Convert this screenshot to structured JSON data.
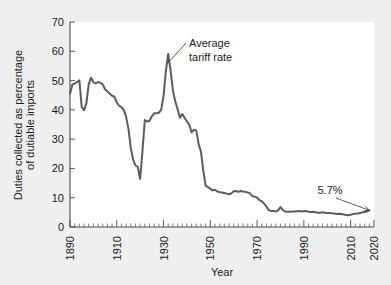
{
  "chart_data": {
    "type": "line",
    "title": "",
    "xlabel": "Year",
    "ylabel": "Duties collected as percentage of dutiable imports",
    "xlim": [
      1890,
      2020
    ],
    "ylim": [
      0,
      70
    ],
    "grid": false,
    "legend_position": "none",
    "y_ticks": [
      0,
      10,
      20,
      30,
      40,
      50,
      60,
      70
    ],
    "y_tick_labels": [
      "0",
      "10",
      "20",
      "30",
      "40",
      "50",
      "60",
      "70"
    ],
    "x_ticks": [
      1890,
      1910,
      1930,
      1950,
      1970,
      1990,
      2010,
      2020
    ],
    "x_tick_labels": [
      "1890",
      "1910",
      "1930",
      "1950",
      "1970",
      "1990",
      "2010",
      "2020"
    ],
    "x_minor_tick_interval": 2,
    "annotations": [
      {
        "name": "series-callout",
        "text": "Average tariff rate",
        "line1": "Average",
        "line2": "tariff rate",
        "target_x": 1931,
        "target_y": 56
      },
      {
        "name": "final-value-callout",
        "text": "5.7%",
        "target_x": 2018,
        "target_y": 5.7
      }
    ],
    "series": [
      {
        "name": "Average tariff rate",
        "color": "#5c5c5c",
        "x": [
          1890,
          1891,
          1892,
          1893,
          1894,
          1895,
          1896,
          1897,
          1898,
          1899,
          1900,
          1901,
          1902,
          1903,
          1904,
          1905,
          1906,
          1907,
          1908,
          1909,
          1910,
          1911,
          1912,
          1913,
          1914,
          1915,
          1916,
          1917,
          1918,
          1919,
          1920,
          1921,
          1922,
          1923,
          1924,
          1925,
          1926,
          1927,
          1928,
          1929,
          1930,
          1931,
          1932,
          1933,
          1934,
          1935,
          1936,
          1937,
          1938,
          1939,
          1940,
          1941,
          1942,
          1943,
          1944,
          1945,
          1946,
          1947,
          1948,
          1949,
          1950,
          1951,
          1952,
          1953,
          1954,
          1955,
          1956,
          1957,
          1958,
          1959,
          1960,
          1961,
          1962,
          1963,
          1964,
          1965,
          1966,
          1967,
          1968,
          1969,
          1970,
          1971,
          1972,
          1973,
          1974,
          1975,
          1976,
          1977,
          1978,
          1979,
          1980,
          1981,
          1982,
          1983,
          1984,
          1985,
          1986,
          1987,
          1988,
          1989,
          1990,
          1991,
          1992,
          1993,
          1994,
          1995,
          1996,
          1997,
          1998,
          1999,
          2000,
          2001,
          2002,
          2003,
          2004,
          2005,
          2006,
          2007,
          2008,
          2009,
          2010,
          2011,
          2012,
          2013,
          2014,
          2015,
          2016,
          2017,
          2018
        ],
        "values": [
          45.5,
          48.6,
          49.0,
          49.5,
          50.1,
          41.0,
          39.9,
          42.2,
          48.8,
          51.0,
          49.5,
          49.0,
          49.5,
          49.2,
          48.7,
          47.0,
          46.3,
          45.5,
          44.8,
          44.5,
          42.5,
          41.4,
          40.9,
          40.0,
          37.6,
          33.5,
          27.0,
          23.0,
          21.0,
          20.5,
          16.4,
          26.0,
          36.5,
          36.0,
          36.3,
          37.8,
          38.8,
          38.8,
          39.0,
          40.1,
          44.7,
          53.2,
          59.1,
          53.6,
          46.7,
          42.9,
          40.3,
          37.3,
          38.6,
          37.3,
          36.0,
          35.0,
          32.3,
          33.2,
          33.0,
          28.3,
          25.7,
          19.3,
          14.1,
          13.6,
          13.1,
          12.5,
          12.7,
          12.1,
          11.9,
          11.8,
          11.6,
          11.4,
          11.2,
          11.5,
          12.2,
          12.3,
          12.0,
          12.3,
          12.1,
          12.0,
          11.8,
          11.5,
          10.5,
          10.4,
          10.0,
          9.2,
          8.8,
          8.0,
          7.0,
          5.7,
          5.5,
          5.5,
          5.3,
          5.7,
          6.8,
          5.8,
          5.3,
          5.2,
          5.2,
          5.3,
          5.3,
          5.4,
          5.5,
          5.3,
          5.4,
          5.5,
          5.2,
          5.1,
          5.2,
          5.0,
          4.9,
          4.9,
          5.0,
          4.9,
          4.8,
          4.8,
          4.7,
          4.6,
          4.4,
          4.5,
          4.4,
          4.3,
          4.1,
          4.0,
          4.2,
          4.4,
          4.5,
          4.6,
          4.8,
          5.0,
          5.1,
          5.3,
          5.7
        ]
      }
    ]
  },
  "figure": {
    "background_color": "#efefef",
    "plot_background_color": "#ffffff",
    "axis_color": "#4a4a4a",
    "line_color": "#5c5c5c"
  }
}
